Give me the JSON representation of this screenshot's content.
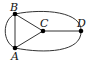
{
  "graph": {
    "nodes": [
      {
        "id": "B",
        "label": "B",
        "x": 15,
        "y": 14,
        "lx": 10,
        "ly": 11
      },
      {
        "id": "C",
        "label": "C",
        "x": 43,
        "y": 31,
        "lx": 40,
        "ly": 27
      },
      {
        "id": "D",
        "label": "D",
        "x": 81,
        "y": 31,
        "lx": 77,
        "ly": 27
      },
      {
        "id": "A",
        "label": "A",
        "x": 15,
        "y": 48,
        "lx": 11,
        "ly": 59
      }
    ],
    "edges": [
      {
        "from": "B",
        "to": "A",
        "type": "straight"
      },
      {
        "from": "B",
        "to": "A",
        "type": "curved-left"
      },
      {
        "from": "B",
        "to": "C",
        "type": "straight"
      },
      {
        "from": "A",
        "to": "C",
        "type": "straight"
      },
      {
        "from": "C",
        "to": "D",
        "type": "straight"
      },
      {
        "from": "B",
        "to": "D",
        "type": "curved-top"
      },
      {
        "from": "A",
        "to": "D",
        "type": "curved-bottom"
      }
    ],
    "colors": {
      "edge": "#333333",
      "node": "#000000",
      "label": "#111111"
    }
  }
}
